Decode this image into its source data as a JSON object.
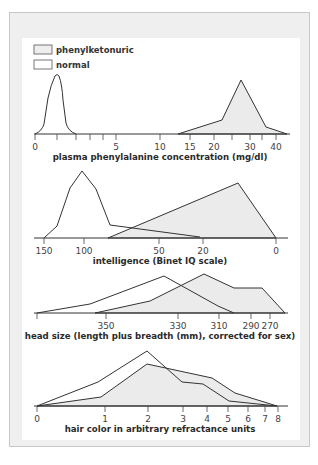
{
  "legend": {
    "items": [
      {
        "label": "phenylketonuric",
        "fill": "#eeeeee"
      },
      {
        "label": "normal",
        "fill": "#ffffff"
      }
    ]
  },
  "colors": {
    "line": "#333333",
    "pku_fill": "#ebebeb",
    "frame_bg": "#efefef",
    "panel_bg": "#ffffff"
  },
  "chart_data": [
    {
      "type": "area",
      "title": "",
      "xlabel": "plasma phenylalanine concentration (mg/dl)",
      "ylabel": "",
      "tick_labels": [
        "0",
        "5",
        "10",
        "15",
        "20",
        "30",
        "40"
      ],
      "series": [
        {
          "name": "normal",
          "description": "narrow peak near ~1 mg/dl, spanning ~0–3"
        },
        {
          "name": "phenylketonuric",
          "description": "broad peak near ~27 mg/dl, spanning ~12–42"
        }
      ]
    },
    {
      "type": "area",
      "title": "",
      "xlabel": "intelligence (Binet IQ scale)",
      "ylabel": "",
      "tick_labels": [
        "150",
        "100",
        "50",
        "20",
        "0"
      ],
      "series": [
        {
          "name": "normal",
          "description": "peak near IQ ~100, spanning ~150–20"
        },
        {
          "name": "phenylketonuric",
          "description": "peak near IQ ~10, spanning ~80–0"
        }
      ]
    },
    {
      "type": "area",
      "title": "",
      "xlabel": "head size (length plus breadth (mm), corrected for sex)",
      "ylabel": "",
      "tick_labels": [
        "350",
        "330",
        "310",
        "290",
        "270"
      ],
      "series": [
        {
          "name": "normal",
          "description": "peak near ~335 mm"
        },
        {
          "name": "phenylketonuric",
          "description": "peak near ~322 mm, shoulder to ~275"
        }
      ]
    },
    {
      "type": "area",
      "title": "",
      "xlabel": "hair color in arbitrary refractance units",
      "ylabel": "",
      "tick_labels": [
        "0",
        "1",
        "2",
        "3",
        "4",
        "5",
        "6",
        "7",
        "8"
      ],
      "series": [
        {
          "name": "normal",
          "description": "peak near 2, spanning 0–8"
        },
        {
          "name": "phenylketonuric",
          "description": "peak near 2–2.5, spanning 0–8, higher at 3–4"
        }
      ]
    }
  ],
  "charts": {
    "c1": {
      "xlabel": "plasma phenylalanine concentration (mg/dl)",
      "ticks": [
        {
          "x": 35,
          "label": "0"
        },
        {
          "x": 57,
          "label": ""
        },
        {
          "x": 76,
          "label": ""
        },
        {
          "x": 90,
          "label": ""
        },
        {
          "x": 103,
          "label": ""
        },
        {
          "x": 116,
          "label": "5"
        },
        {
          "x": 160,
          "label": "10"
        },
        {
          "x": 190,
          "label": "15"
        },
        {
          "x": 214,
          "label": "20"
        },
        {
          "x": 232,
          "label": ""
        },
        {
          "x": 250,
          "label": "30"
        },
        {
          "x": 262,
          "label": ""
        },
        {
          "x": 276,
          "label": "40"
        }
      ]
    },
    "c2": {
      "xlabel": "intelligence (Binet IQ scale)",
      "ticks": [
        {
          "x": 44,
          "label": "150"
        },
        {
          "x": 84,
          "label": "100"
        },
        {
          "x": 159,
          "label": "50"
        },
        {
          "x": 203,
          "label": "20"
        },
        {
          "x": 276,
          "label": "0"
        }
      ]
    },
    "c3": {
      "xlabel": "head size (length plus breadth (mm), corrected for sex)",
      "ticks": [
        {
          "x": 37,
          "label": ""
        },
        {
          "x": 106,
          "label": "350"
        },
        {
          "x": 178,
          "label": "330"
        },
        {
          "x": 219,
          "label": "310"
        },
        {
          "x": 251,
          "label": "290"
        },
        {
          "x": 270,
          "label": "270"
        }
      ]
    },
    "c4": {
      "xlabel": "hair color in arbitrary refractance units",
      "ticks": [
        {
          "x": 37,
          "label": "0"
        },
        {
          "x": 105,
          "label": "1"
        },
        {
          "x": 148,
          "label": "2"
        },
        {
          "x": 183,
          "label": "3"
        },
        {
          "x": 207,
          "label": "4"
        },
        {
          "x": 228,
          "label": "5"
        },
        {
          "x": 248,
          "label": "6"
        },
        {
          "x": 265,
          "label": "7"
        },
        {
          "x": 278,
          "label": "8"
        }
      ]
    }
  }
}
